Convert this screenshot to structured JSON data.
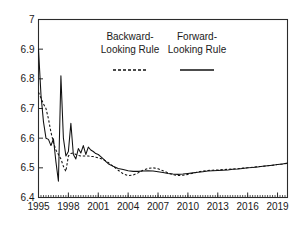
{
  "chart_data": {
    "type": "line",
    "title": "",
    "xlabel": "",
    "ylabel": "",
    "xlim": [
      1995.0,
      2020.0
    ],
    "ylim": [
      6.4,
      7.0
    ],
    "grid": false,
    "y_ticks": [
      "6.4",
      "6.5",
      "6.6",
      "6.7",
      "6.8",
      "6.9",
      "7"
    ],
    "y_tick_values": [
      6.4,
      6.5,
      6.6,
      6.7,
      6.8,
      6.9,
      7.0
    ],
    "x_ticks": [
      "1995",
      "1998",
      "2001",
      "2004",
      "2007",
      "2010",
      "2013",
      "2016",
      "2019"
    ],
    "x_tick_values": [
      1995,
      1998,
      2001,
      2004,
      2007,
      2010,
      2013,
      2016,
      2019
    ],
    "x_minor_step": 0.25,
    "legend_position": "top-center-inside",
    "series": [
      {
        "name": "Backward-Looking Rule",
        "style": "dashed",
        "color": "#111111",
        "x": [
          1995.0,
          1995.25,
          1995.5,
          1995.75,
          1996.0,
          1996.25,
          1996.5,
          1996.75,
          1997.0,
          1997.25,
          1997.5,
          1997.75,
          1998.0,
          1998.25,
          1998.5,
          1998.75,
          1999.0,
          1999.25,
          1999.5,
          1999.75,
          2000.0,
          2000.25,
          2000.5,
          2000.75,
          2001.0,
          2001.5,
          2002.0,
          2002.5,
          2003.0,
          2003.5,
          2004.0,
          2004.5,
          2005.0,
          2005.5,
          2006.0,
          2006.5,
          2007.0,
          2007.5,
          2008.0,
          2008.5,
          2009.0,
          2009.5,
          2010.0,
          2010.5,
          2011.0,
          2011.5,
          2012.0,
          2012.5,
          2013.0,
          2013.5,
          2014.0,
          2014.5,
          2015.0,
          2015.5,
          2016.0,
          2016.5,
          2017.0,
          2017.5,
          2018.0,
          2018.5,
          2019.0,
          2019.5,
          2020.0
        ],
        "values": [
          6.755,
          6.735,
          6.715,
          6.7,
          6.665,
          6.62,
          6.585,
          6.56,
          6.545,
          6.53,
          6.505,
          6.488,
          6.54,
          6.548,
          6.55,
          6.545,
          6.542,
          6.54,
          6.54,
          6.54,
          6.54,
          6.538,
          6.538,
          6.536,
          6.534,
          6.528,
          6.518,
          6.505,
          6.492,
          6.48,
          6.474,
          6.476,
          6.483,
          6.492,
          6.498,
          6.5,
          6.497,
          6.49,
          6.483,
          6.477,
          6.474,
          6.475,
          6.478,
          6.482,
          6.486,
          6.489,
          6.491,
          6.492,
          6.493,
          6.494,
          6.495,
          6.496,
          6.497,
          6.499,
          6.5,
          6.502,
          6.504,
          6.505,
          6.507,
          6.509,
          6.511,
          6.513,
          6.515
        ]
      },
      {
        "name": "Forward-Looking Rule",
        "style": "solid",
        "color": "#111111",
        "x": [
          1995.0,
          1995.25,
          1995.5,
          1995.75,
          1996.0,
          1996.25,
          1996.5,
          1996.75,
          1997.0,
          1997.25,
          1997.5,
          1997.75,
          1998.0,
          1998.25,
          1998.5,
          1998.75,
          1999.0,
          1999.25,
          1999.5,
          1999.75,
          2000.0,
          2000.25,
          2000.5,
          2000.75,
          2001.0,
          2001.25,
          2001.5,
          2001.75,
          2002.0,
          2002.5,
          2003.0,
          2003.5,
          2004.0,
          2004.5,
          2005.0,
          2005.5,
          2006.0,
          2006.5,
          2007.0,
          2007.5,
          2008.0,
          2008.5,
          2009.0,
          2009.5,
          2010.0,
          2010.5,
          2011.0,
          2011.5,
          2012.0,
          2012.5,
          2013.0,
          2013.5,
          2014.0,
          2014.5,
          2015.0,
          2015.5,
          2016.0,
          2016.5,
          2017.0,
          2017.5,
          2018.0,
          2018.5,
          2019.0,
          2019.5,
          2020.0
        ],
        "values": [
          6.9,
          6.745,
          6.655,
          6.6,
          6.596,
          6.575,
          6.598,
          6.52,
          6.455,
          6.81,
          6.6,
          6.54,
          6.555,
          6.65,
          6.545,
          6.53,
          6.565,
          6.55,
          6.575,
          6.545,
          6.57,
          6.56,
          6.555,
          6.548,
          6.545,
          6.538,
          6.53,
          6.522,
          6.514,
          6.505,
          6.498,
          6.494,
          6.49,
          6.488,
          6.488,
          6.489,
          6.49,
          6.489,
          6.487,
          6.484,
          6.481,
          6.479,
          6.478,
          6.479,
          6.481,
          6.483,
          6.485,
          6.487,
          6.489,
          6.49,
          6.491,
          6.492,
          6.493,
          6.495,
          6.496,
          6.498,
          6.5,
          6.501,
          6.503,
          6.505,
          6.507,
          6.509,
          6.511,
          6.513,
          6.516
        ]
      }
    ],
    "legend": [
      {
        "line1": "Backward-",
        "line2": "Looking Rule",
        "style": "dashed"
      },
      {
        "line1": "Forward-",
        "line2": "Looking Rule",
        "style": "solid"
      }
    ]
  }
}
